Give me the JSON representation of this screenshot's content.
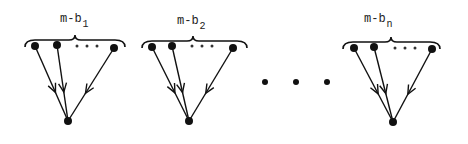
{
  "diagram": {
    "type": "bipartite-fan-in",
    "colors": {
      "ink": "#111111",
      "background": "#ffffff"
    },
    "groups": [
      {
        "label": "m-b",
        "subscript": "1",
        "brace": {
          "x1": 25,
          "x2": 125,
          "y": 40,
          "peak_x": 75
        },
        "label_pos": {
          "x": 60,
          "y": 22
        },
        "sources": [
          {
            "x": 35,
            "y": 46
          },
          {
            "x": 57,
            "y": 45
          },
          {
            "x": 114,
            "y": 48
          }
        ],
        "inner_dots": [
          {
            "x": 77,
            "y": 46
          },
          {
            "x": 87,
            "y": 46
          },
          {
            "x": 97,
            "y": 46
          }
        ],
        "sink": {
          "x": 68,
          "y": 121
        }
      },
      {
        "label": "m-b",
        "subscript": "2",
        "brace": {
          "x1": 142,
          "x2": 247,
          "y": 41,
          "peak_x": 193
        },
        "label_pos": {
          "x": 177,
          "y": 24
        },
        "sources": [
          {
            "x": 152,
            "y": 47
          },
          {
            "x": 172,
            "y": 46
          },
          {
            "x": 233,
            "y": 48
          }
        ],
        "inner_dots": [
          {
            "x": 192,
            "y": 46
          },
          {
            "x": 202,
            "y": 46
          },
          {
            "x": 212,
            "y": 46
          }
        ],
        "sink": {
          "x": 189,
          "y": 121
        }
      },
      {
        "label": "m-b",
        "subscript": "n",
        "brace": {
          "x1": 343,
          "x2": 440,
          "y": 42,
          "peak_x": 391
        },
        "label_pos": {
          "x": 364,
          "y": 22
        },
        "sources": [
          {
            "x": 354,
            "y": 48
          },
          {
            "x": 374,
            "y": 47
          },
          {
            "x": 432,
            "y": 49
          }
        ],
        "inner_dots": [
          {
            "x": 395,
            "y": 48
          },
          {
            "x": 405,
            "y": 48
          },
          {
            "x": 415,
            "y": 48
          }
        ],
        "sink": {
          "x": 393,
          "y": 122
        }
      }
    ],
    "between_ellipsis": [
      {
        "x": 265,
        "y": 82
      },
      {
        "x": 296,
        "y": 82
      },
      {
        "x": 327,
        "y": 82
      }
    ]
  }
}
